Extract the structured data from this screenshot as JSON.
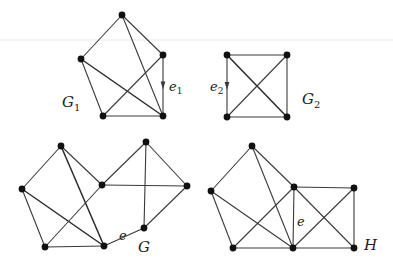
{
  "figure": {
    "type": "graph-diagram"
  },
  "colors": {
    "background": "#ffffff",
    "edge": "#3a3a3a",
    "vertex": "#111111",
    "label": "#222222"
  },
  "graphs": [
    {
      "id": "G1",
      "label": "G",
      "subscript": "1",
      "label_pos": [
        62,
        103
      ],
      "vertices": [
        [
          122,
          15
        ],
        [
          81,
          59
        ],
        [
          163,
          55
        ],
        [
          103,
          116
        ],
        [
          163,
          116
        ]
      ],
      "edges": [
        [
          0,
          1
        ],
        [
          0,
          2
        ],
        [
          0,
          4
        ],
        [
          1,
          3
        ],
        [
          1,
          4
        ],
        [
          2,
          3
        ],
        [
          2,
          4
        ],
        [
          3,
          4
        ]
      ],
      "thick_edges": [
        [
          1,
          4
        ]
      ],
      "special_edge": {
        "name": "e",
        "subscript": "1",
        "from": 2,
        "to": 4,
        "label_pos": [
          169,
          88
        ],
        "arrow": true
      }
    },
    {
      "id": "G2",
      "label": "G",
      "subscript": "2",
      "label_pos": [
        303,
        100
      ],
      "vertices": [
        [
          227,
          55
        ],
        [
          287,
          55
        ],
        [
          227,
          117
        ],
        [
          287,
          117
        ]
      ],
      "edges": [
        [
          0,
          1
        ],
        [
          0,
          2
        ],
        [
          0,
          3
        ],
        [
          1,
          2
        ],
        [
          1,
          3
        ],
        [
          2,
          3
        ]
      ],
      "thick_edges": [
        [
          0,
          3
        ]
      ],
      "special_edge": {
        "name": "e",
        "subscript": "2",
        "from": 0,
        "to": 2,
        "label_pos": [
          211,
          88
        ],
        "arrow": true
      }
    },
    {
      "id": "G",
      "label": "G",
      "subscript": "",
      "label_pos": [
        139,
        248
      ],
      "vertices": [
        [
          61,
          146
        ],
        [
          22,
          189
        ],
        [
          45,
          247
        ],
        [
          104,
          246
        ],
        [
          102,
          185
        ],
        [
          146,
          142
        ],
        [
          187,
          186
        ],
        [
          144,
          228
        ]
      ],
      "edges": [
        [
          0,
          1
        ],
        [
          0,
          3
        ],
        [
          0,
          4
        ],
        [
          1,
          2
        ],
        [
          1,
          3
        ],
        [
          2,
          3
        ],
        [
          2,
          4
        ],
        [
          4,
          5
        ],
        [
          4,
          6
        ],
        [
          5,
          6
        ],
        [
          5,
          7
        ],
        [
          6,
          7
        ],
        [
          3,
          7
        ]
      ],
      "thick_edges": [
        [
          0,
          3
        ],
        [
          1,
          3
        ]
      ],
      "special_edge": {
        "name": "e",
        "subscript": "",
        "from": 3,
        "to": 7,
        "label_pos": [
          120,
          237
        ],
        "arrow": false
      }
    },
    {
      "id": "H",
      "label": "H",
      "subscript": "",
      "label_pos": [
        366,
        247
      ],
      "vertices": [
        [
          252,
          146
        ],
        [
          211,
          191
        ],
        [
          233,
          248
        ],
        [
          293,
          248
        ],
        [
          294,
          187
        ],
        [
          354,
          188
        ],
        [
          354,
          248
        ]
      ],
      "edges": [
        [
          0,
          1
        ],
        [
          0,
          3
        ],
        [
          0,
          4
        ],
        [
          1,
          2
        ],
        [
          1,
          3
        ],
        [
          2,
          3
        ],
        [
          2,
          4
        ],
        [
          3,
          4
        ],
        [
          4,
          5
        ],
        [
          4,
          6
        ],
        [
          3,
          5
        ],
        [
          5,
          6
        ],
        [
          3,
          6
        ]
      ],
      "thick_edges": [],
      "special_edge": {
        "name": "e",
        "subscript": "",
        "from": 4,
        "to": 3,
        "label_pos": [
          298,
          223
        ],
        "arrow": false
      }
    }
  ],
  "labels": {
    "G1": "G",
    "G1_sub": "1",
    "G2": "G",
    "G2_sub": "2",
    "e1": "e",
    "e1_sub": "1",
    "e2": "e",
    "e2_sub": "2",
    "G": "G",
    "G_e": "e",
    "H": "H",
    "H_e": "e"
  }
}
